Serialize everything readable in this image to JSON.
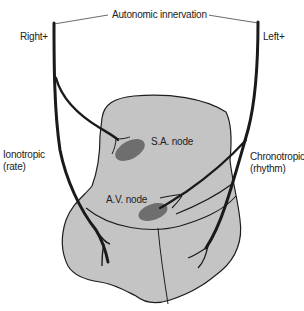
{
  "diagram": {
    "title": "Autonomic innervation",
    "labels": {
      "right_nerve": "Right+",
      "left_nerve": "Left+",
      "ionotropic_line1": "Ionotropic",
      "ionotropic_line2": "(rate)",
      "chronotropic_line1": "Chronotropic",
      "chronotropic_line2": "(rhythm)",
      "sa_node": "S.A. node",
      "av_node": "A.V. node"
    },
    "colors": {
      "heart_fill": "#c4c4c4",
      "node_fill": "#6e6e6e",
      "nerve_stroke": "#1a1a1a",
      "outline_stroke": "#1e1e1e",
      "text": "#222222"
    }
  }
}
